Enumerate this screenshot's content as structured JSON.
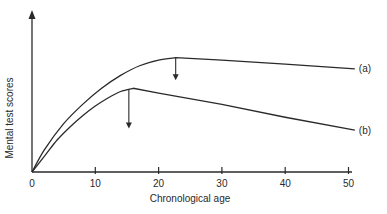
{
  "chart_data": {
    "type": "line",
    "title": "",
    "xlabel": "Chronological age",
    "ylabel": "Mental test scores",
    "xlim": [
      0,
      52
    ],
    "ylim": [
      0,
      100
    ],
    "x_ticks": [
      0,
      10,
      20,
      30,
      40,
      50
    ],
    "x_tick_labels": [
      "0",
      "10",
      "20",
      "30",
      "40",
      "50"
    ],
    "y_ticks": [],
    "grid": false,
    "y_units": "relative (unlabeled axis)",
    "series": [
      {
        "name": "(a)",
        "label": "(a)",
        "peak": {
          "x": 22.7,
          "y": 71
        },
        "points": [
          [
            0,
            0
          ],
          [
            2,
            14
          ],
          [
            5,
            30
          ],
          [
            8,
            42
          ],
          [
            11,
            52
          ],
          [
            14,
            60
          ],
          [
            17,
            66
          ],
          [
            20,
            69.5
          ],
          [
            22.7,
            71
          ],
          [
            30,
            69.5
          ],
          [
            40,
            67
          ],
          [
            51,
            64
          ]
        ]
      },
      {
        "name": "(b)",
        "label": "(b)",
        "peak": {
          "x": 16,
          "y": 52
        },
        "points": [
          [
            0,
            0
          ],
          [
            2,
            10
          ],
          [
            4,
            20
          ],
          [
            6,
            28
          ],
          [
            8,
            35
          ],
          [
            10,
            41
          ],
          [
            12,
            46
          ],
          [
            14,
            50
          ],
          [
            16,
            52
          ],
          [
            20,
            49
          ],
          [
            30,
            42
          ],
          [
            40,
            34
          ],
          [
            51,
            26
          ]
        ]
      }
    ],
    "annotations": [
      {
        "type": "arrow-down",
        "series": "(a)",
        "x": 22.7,
        "y_from": 71,
        "y_to": 57
      },
      {
        "type": "arrow-down",
        "series": "(b)",
        "x": 15.3,
        "y_from": 51.5,
        "y_to": 27
      }
    ],
    "caption": "Figure 5.?"
  }
}
